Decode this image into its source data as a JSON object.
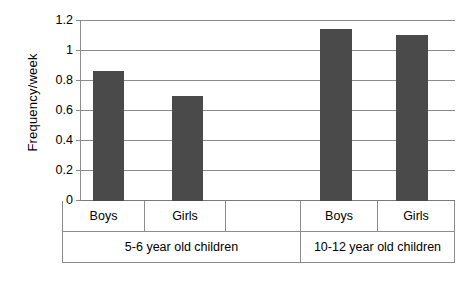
{
  "chart_data": {
    "type": "bar",
    "title": "",
    "subtitle": "",
    "xlabel": "",
    "ylabel": "Frequency/week",
    "ylim": [
      0,
      1.2
    ],
    "ytick_labels": [
      "1.2",
      "1",
      "0.8",
      "0.6",
      "0.4",
      "0.2",
      "0"
    ],
    "ytick_values": [
      1.2,
      1.0,
      0.8,
      0.6,
      0.4,
      0.2,
      0
    ],
    "grid": true,
    "legend": "none",
    "bar_color": "#4a4a4a",
    "categories": [
      "Boys",
      "Girls",
      "Boys",
      "Girls"
    ],
    "values": [
      0.87,
      0.7,
      1.15,
      1.11
    ],
    "groups": [
      {
        "label": "5-6 year old children",
        "categories": [
          "Boys",
          "Girls"
        ],
        "values": [
          0.87,
          0.7
        ]
      },
      {
        "label": "10-12 year old children",
        "categories": [
          "Boys",
          "Girls"
        ],
        "values": [
          1.15,
          1.11
        ]
      }
    ],
    "series": [
      {
        "name": "Frequency/week",
        "values": [
          0.87,
          0.7,
          1.15,
          1.11
        ]
      }
    ],
    "annotations": []
  },
  "axis": {
    "y_title": "Frequency/week",
    "ticks": [
      {
        "label": "1.2"
      },
      {
        "label": "1"
      },
      {
        "label": "0.8"
      },
      {
        "label": "0.6"
      },
      {
        "label": "0.4"
      },
      {
        "label": "0.2"
      },
      {
        "label": "0"
      }
    ]
  },
  "table": {
    "row_categories": [
      "Boys",
      "Girls",
      "",
      "Boys",
      "Girls"
    ],
    "row_groups": [
      "5-6 year old children",
      "10-12 year old children"
    ]
  }
}
